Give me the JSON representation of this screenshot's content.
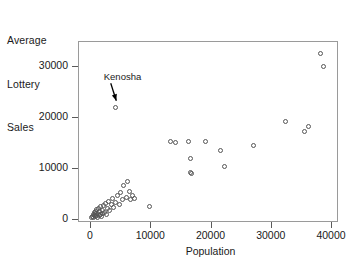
{
  "chart_data": {
    "type": "scatter",
    "title": "",
    "ylabel": "Average Lottery Sales",
    "ylabel_lines": [
      "Average",
      "Lottery",
      "Sales"
    ],
    "xlabel": "Population",
    "xlim": [
      -1600,
      41500
    ],
    "ylim": [
      -2000,
      34300
    ],
    "grid": false,
    "legend": null,
    "xticks": [
      0,
      10000,
      20000,
      30000,
      40000
    ],
    "xtick_labels": [
      "0",
      "10000",
      "20000",
      "30000",
      "40000"
    ],
    "yticks": [
      0,
      10000,
      20000,
      30000
    ],
    "ytick_labels": [
      "0",
      "10000",
      "20000",
      "30000"
    ],
    "marker": "open-circle",
    "marker_color": "#555555",
    "annotations": [
      {
        "text": "Kenosha",
        "text_x": 5600,
        "text_y": 27600,
        "point_x": 4200,
        "point_y": 21800,
        "arrow": true
      }
    ],
    "points": [
      {
        "x": 300,
        "y": 300
      },
      {
        "x": 420,
        "y": 520
      },
      {
        "x": 560,
        "y": 250
      },
      {
        "x": 620,
        "y": 900
      },
      {
        "x": 700,
        "y": 600
      },
      {
        "x": 760,
        "y": 1250
      },
      {
        "x": 830,
        "y": 400
      },
      {
        "x": 900,
        "y": 1000
      },
      {
        "x": 980,
        "y": 1500
      },
      {
        "x": 1050,
        "y": 700
      },
      {
        "x": 1150,
        "y": 1800
      },
      {
        "x": 1200,
        "y": 350
      },
      {
        "x": 1300,
        "y": 1100
      },
      {
        "x": 1400,
        "y": 2100
      },
      {
        "x": 1500,
        "y": 600
      },
      {
        "x": 1600,
        "y": 1400
      },
      {
        "x": 1700,
        "y": 900
      },
      {
        "x": 1800,
        "y": 2400
      },
      {
        "x": 1900,
        "y": 500
      },
      {
        "x": 2000,
        "y": 1700
      },
      {
        "x": 2100,
        "y": 1000
      },
      {
        "x": 2300,
        "y": 2600
      },
      {
        "x": 2400,
        "y": 1300
      },
      {
        "x": 2600,
        "y": 3100
      },
      {
        "x": 2700,
        "y": 800
      },
      {
        "x": 2900,
        "y": 2000
      },
      {
        "x": 3100,
        "y": 3500
      },
      {
        "x": 3300,
        "y": 1600
      },
      {
        "x": 3500,
        "y": 2800
      },
      {
        "x": 3700,
        "y": 4100
      },
      {
        "x": 3900,
        "y": 2300
      },
      {
        "x": 4200,
        "y": 21800
      },
      {
        "x": 4300,
        "y": 3300
      },
      {
        "x": 4600,
        "y": 4600
      },
      {
        "x": 4900,
        "y": 2900
      },
      {
        "x": 5100,
        "y": 5200
      },
      {
        "x": 5400,
        "y": 3800
      },
      {
        "x": 5600,
        "y": 6600
      },
      {
        "x": 6000,
        "y": 4300
      },
      {
        "x": 6300,
        "y": 7400
      },
      {
        "x": 6600,
        "y": 5400
      },
      {
        "x": 6800,
        "y": 3900
      },
      {
        "x": 7100,
        "y": 4700
      },
      {
        "x": 7400,
        "y": 4100
      },
      {
        "x": 9900,
        "y": 2400
      },
      {
        "x": 13400,
        "y": 15200
      },
      {
        "x": 14200,
        "y": 15000
      },
      {
        "x": 16300,
        "y": 15100
      },
      {
        "x": 16600,
        "y": 11900
      },
      {
        "x": 16700,
        "y": 9200
      },
      {
        "x": 16800,
        "y": 9000
      },
      {
        "x": 19200,
        "y": 15200
      },
      {
        "x": 21600,
        "y": 13400
      },
      {
        "x": 22400,
        "y": 10300
      },
      {
        "x": 27200,
        "y": 14400
      },
      {
        "x": 32400,
        "y": 19200
      },
      {
        "x": 35600,
        "y": 17200
      },
      {
        "x": 36200,
        "y": 18200
      },
      {
        "x": 38300,
        "y": 32500
      },
      {
        "x": 38700,
        "y": 30000
      }
    ]
  }
}
